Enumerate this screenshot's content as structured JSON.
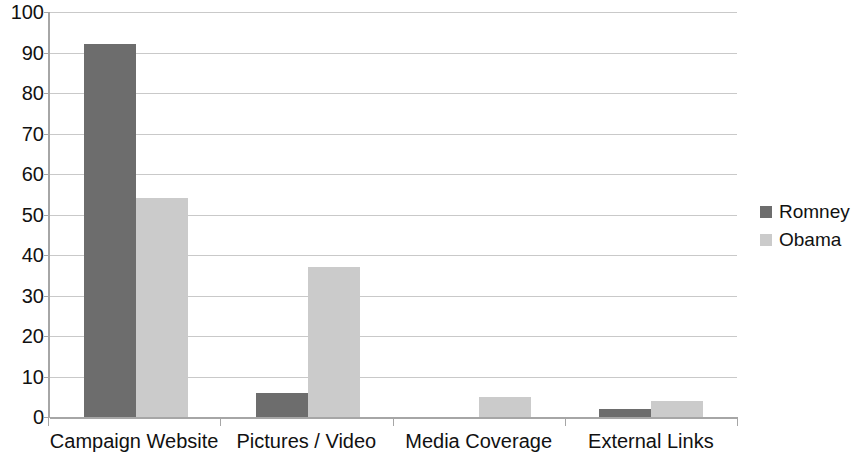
{
  "chart_data": {
    "type": "bar",
    "title": "",
    "subtitle": "",
    "xlabel": "",
    "ylabel": "",
    "categories": [
      "Campaign Website",
      "Pictures / Video",
      "Media Coverage",
      "External Links"
    ],
    "series": [
      {
        "name": "Romney",
        "color": "#6d6d6d",
        "values": [
          92,
          6,
          0,
          2
        ]
      },
      {
        "name": "Obama",
        "color": "#cbcbcb",
        "values": [
          54,
          37,
          5,
          4
        ]
      }
    ],
    "ylim": [
      0,
      100
    ],
    "ytick_step": 10,
    "ytick_labels": [
      "100",
      "90",
      "80",
      "70",
      "60",
      "50",
      "40",
      "30",
      "20",
      "10",
      "0"
    ],
    "grid": true,
    "grid_axis": "y",
    "legend_position": "right",
    "annotations": []
  },
  "legend": {
    "items": [
      {
        "label": "Romney",
        "swatch": "legend-swatch-romney"
      },
      {
        "label": "Obama",
        "swatch": "legend-swatch-obama"
      }
    ]
  },
  "colors": {
    "series_romney": "#6d6d6d",
    "series_obama": "#cbcbcb",
    "gridline": "#c9c9c9",
    "axis": "#a6a6a6",
    "text": "#111111",
    "background": "#ffffff"
  }
}
